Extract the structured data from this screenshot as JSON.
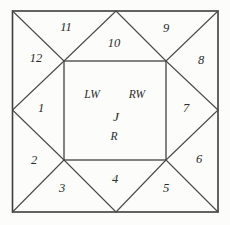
{
  "diagram": {
    "background_color": "#fcfcfa",
    "line_color": "#3d3d3d",
    "text_color": "#2b2b2b",
    "triangle_labels": [
      "1",
      "2",
      "3",
      "4",
      "5",
      "6",
      "7",
      "8",
      "9",
      "10",
      "11",
      "12"
    ],
    "center_labels": {
      "lw": "LW",
      "rw": "RW",
      "j": "J",
      "r": "R"
    }
  }
}
